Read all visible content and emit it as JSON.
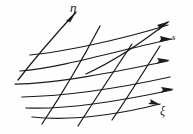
{
  "figure": {
    "type": "diagram",
    "width": 193,
    "height": 134,
    "background_color": "#fefefe",
    "stroke_color": "#1b1b1b",
    "labels": {
      "eta": "η",
      "s": "s",
      "xi": "ξ"
    },
    "label_positions": {
      "eta": [
        70,
        1
      ],
      "s": [
        172,
        33
      ],
      "xi": [
        160,
        105
      ]
    },
    "xi_curves": [
      {
        "name": "xi-curve-1",
        "path": "M 86 74 C 112 62, 140 44, 168 22",
        "arrow": true,
        "arrow_at": [
          168,
          22
        ],
        "arrow_angle": -38
      },
      {
        "name": "xi-curve-2",
        "path": "M 30 55 C 62 52, 120 40, 168 25",
        "arrow": false
      },
      {
        "name": "xi-curve-3",
        "path": "M 20 71 C 60 68, 120 50, 172 39",
        "arrow": true,
        "arrow_at": [
          172,
          39
        ],
        "arrow_angle": -14
      },
      {
        "name": "xi-curve-4",
        "path": "M 15 84 C 55 84, 115 72, 168 61",
        "arrow": true,
        "arrow_at": [
          168,
          61
        ],
        "arrow_angle": -13
      },
      {
        "name": "xi-curve-5",
        "path": "M 22 97 C 64 96, 120 88, 170 77",
        "arrow": false
      },
      {
        "name": "xi-curve-6",
        "path": "M 26 108 C 70 110, 125 100, 172 90",
        "arrow": true,
        "arrow_at": [
          172,
          90
        ],
        "arrow_angle": -13
      },
      {
        "name": "xi-curve-7",
        "path": "M 32 117 C 80 122, 128 112, 160 104",
        "arrow": true,
        "arrow_at": [
          160,
          104
        ],
        "arrow_angle": 16
      }
    ],
    "eta_curves": [
      {
        "name": "eta-curve-1",
        "path": "M 18 80 C 32 62, 54 36, 76 12",
        "arrow": true,
        "arrow_at": [
          76,
          12
        ],
        "arrow_angle": -48
      },
      {
        "name": "eta-curve-2",
        "path": "M 42 124 C 58 100, 78 68, 100 26",
        "arrow": false
      },
      {
        "name": "eta-curve-3",
        "path": "M 78 126 C 92 104, 112 74, 132 44",
        "arrow": false
      },
      {
        "name": "eta-curve-4",
        "path": "M 112 120 C 126 100, 146 68, 160 46",
        "arrow": false
      }
    ]
  }
}
